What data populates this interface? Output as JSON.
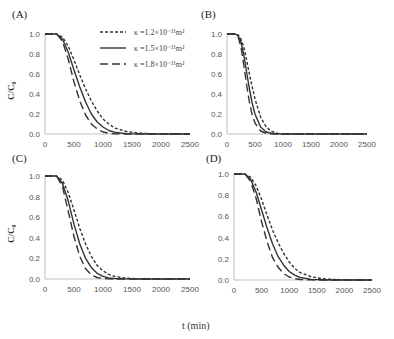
{
  "figure": {
    "x_axis_label": "t (min)",
    "y_axis_label": "C/C₀",
    "legend": [
      {
        "label": "κ =1.2×10⁻¹¹m²",
        "style": "short-dash"
      },
      {
        "label": "κ =1.5×10⁻¹¹m²",
        "style": "solid"
      },
      {
        "label": "κ =1.8×10⁻¹¹m²",
        "style": "long-dash"
      }
    ],
    "line_color": "#333333",
    "axis_color": "#bfbfbf"
  },
  "chart_data": [
    {
      "panel": "(A)",
      "type": "line",
      "title": "(A)",
      "xlabel": "t (min)",
      "ylabel": "C/C₀",
      "xlim": [
        0,
        2500
      ],
      "ylim": [
        0,
        1.0
      ],
      "xticks": [
        "0",
        "500",
        "1000",
        "1500",
        "2000",
        "2500"
      ],
      "yticks": [
        "0.0",
        "0.2",
        "0.4",
        "0.6",
        "0.8",
        "1.0"
      ],
      "grid": false,
      "legend_position": "upper right",
      "x": [
        0,
        200,
        300,
        400,
        500,
        600,
        700,
        800,
        900,
        1000,
        1100,
        1200,
        1400,
        1600,
        1800,
        2000,
        2500
      ],
      "series": [
        {
          "name": "κ =1.2×10⁻¹¹m²",
          "style": "short-dash",
          "values": [
            1.0,
            1.0,
            0.97,
            0.88,
            0.74,
            0.59,
            0.45,
            0.33,
            0.23,
            0.15,
            0.1,
            0.06,
            0.025,
            0.01,
            0.004,
            0.001,
            0.0
          ]
        },
        {
          "name": "κ =1.5×10⁻¹¹m²",
          "style": "solid",
          "values": [
            1.0,
            1.0,
            0.95,
            0.82,
            0.64,
            0.47,
            0.32,
            0.2,
            0.12,
            0.07,
            0.035,
            0.018,
            0.004,
            0.001,
            0.0,
            0.0,
            0.0
          ]
        },
        {
          "name": "κ =1.8×10⁻¹¹m²",
          "style": "long-dash",
          "values": [
            1.0,
            1.0,
            0.93,
            0.75,
            0.52,
            0.33,
            0.19,
            0.1,
            0.05,
            0.02,
            0.008,
            0.003,
            0.0,
            0.0,
            0.0,
            0.0,
            0.0
          ]
        }
      ]
    },
    {
      "panel": "(B)",
      "type": "line",
      "title": "(B)",
      "xlabel": "t (min)",
      "ylabel": "C/C₀",
      "xlim": [
        0,
        2500
      ],
      "ylim": [
        0,
        1.0
      ],
      "xticks": [
        "0",
        "500",
        "1000",
        "1500",
        "2000",
        "2500"
      ],
      "yticks": [
        "0.0",
        "0.2",
        "0.4",
        "0.6",
        "0.8",
        "1.0"
      ],
      "grid": false,
      "x": [
        0,
        150,
        200,
        250,
        300,
        350,
        400,
        450,
        500,
        600,
        700,
        800,
        900,
        1000,
        1500,
        2000,
        2500
      ],
      "series": [
        {
          "name": "κ =1.2×10⁻¹¹m²",
          "style": "short-dash",
          "values": [
            1.0,
            1.0,
            0.99,
            0.95,
            0.87,
            0.74,
            0.6,
            0.47,
            0.35,
            0.17,
            0.07,
            0.025,
            0.008,
            0.002,
            0.0,
            0.0,
            0.0
          ]
        },
        {
          "name": "κ =1.5×10⁻¹¹m²",
          "style": "solid",
          "values": [
            1.0,
            1.0,
            0.98,
            0.92,
            0.79,
            0.62,
            0.45,
            0.31,
            0.2,
            0.07,
            0.02,
            0.005,
            0.001,
            0.0,
            0.0,
            0.0,
            0.0
          ]
        },
        {
          "name": "κ =1.8×10⁻¹¹m²",
          "style": "long-dash",
          "values": [
            1.0,
            1.0,
            0.97,
            0.87,
            0.69,
            0.49,
            0.32,
            0.19,
            0.11,
            0.03,
            0.007,
            0.001,
            0.0,
            0.0,
            0.0,
            0.0,
            0.0
          ]
        }
      ]
    },
    {
      "panel": "(C)",
      "type": "line",
      "title": "(C)",
      "xlabel": "t (min)",
      "ylabel": "C/C₀",
      "xlim": [
        0,
        2500
      ],
      "ylim": [
        0,
        1.0
      ],
      "xticks": [
        "0",
        "500",
        "1000",
        "1500",
        "2000",
        "2500"
      ],
      "yticks": [
        "0.0",
        "0.2",
        "0.4",
        "0.6",
        "0.8",
        "1.0"
      ],
      "grid": false,
      "x": [
        0,
        200,
        300,
        400,
        500,
        600,
        700,
        800,
        900,
        1000,
        1100,
        1200,
        1400,
        1600,
        1800,
        2000,
        2500
      ],
      "series": [
        {
          "name": "κ =1.2×10⁻¹¹m²",
          "style": "short-dash",
          "values": [
            1.0,
            1.0,
            0.96,
            0.84,
            0.67,
            0.49,
            0.34,
            0.22,
            0.13,
            0.08,
            0.045,
            0.025,
            0.008,
            0.002,
            0.0,
            0.0,
            0.0
          ]
        },
        {
          "name": "κ =1.5×10⁻¹¹m²",
          "style": "solid",
          "values": [
            1.0,
            1.0,
            0.93,
            0.76,
            0.53,
            0.34,
            0.2,
            0.11,
            0.055,
            0.025,
            0.011,
            0.005,
            0.001,
            0.0,
            0.0,
            0.0,
            0.0
          ]
        },
        {
          "name": "κ =1.8×10⁻¹¹m²",
          "style": "long-dash",
          "values": [
            1.0,
            1.0,
            0.9,
            0.66,
            0.41,
            0.22,
            0.1,
            0.04,
            0.015,
            0.005,
            0.001,
            0.0,
            0.0,
            0.0,
            0.0,
            0.0,
            0.0
          ]
        }
      ]
    },
    {
      "panel": "(D)",
      "type": "line",
      "title": "(D)",
      "xlabel": "t (min)",
      "ylabel": "C/C₀",
      "xlim": [
        0,
        2500
      ],
      "ylim": [
        0,
        1.0
      ],
      "xticks": [
        "0",
        "500",
        "1000",
        "1500",
        "2000",
        "2500"
      ],
      "yticks": [
        "0.0",
        "0.2",
        "0.4",
        "0.6",
        "0.8",
        "1.0"
      ],
      "grid": false,
      "x": [
        0,
        200,
        300,
        400,
        500,
        600,
        700,
        800,
        900,
        1000,
        1100,
        1200,
        1400,
        1600,
        1800,
        2000,
        2500
      ],
      "series": [
        {
          "name": "κ =1.2×10⁻¹¹m²",
          "style": "short-dash",
          "values": [
            1.0,
            1.0,
            0.97,
            0.89,
            0.76,
            0.61,
            0.47,
            0.35,
            0.25,
            0.17,
            0.11,
            0.07,
            0.03,
            0.012,
            0.005,
            0.002,
            0.0
          ]
        },
        {
          "name": "κ =1.5×10⁻¹¹m²",
          "style": "solid",
          "values": [
            1.0,
            1.0,
            0.95,
            0.83,
            0.66,
            0.49,
            0.34,
            0.22,
            0.14,
            0.08,
            0.045,
            0.024,
            0.006,
            0.002,
            0.0,
            0.0,
            0.0
          ]
        },
        {
          "name": "κ =1.8×10⁻¹¹m²",
          "style": "long-dash",
          "values": [
            1.0,
            1.0,
            0.93,
            0.77,
            0.55,
            0.36,
            0.21,
            0.12,
            0.06,
            0.028,
            0.012,
            0.005,
            0.001,
            0.0,
            0.0,
            0.0,
            0.0
          ]
        }
      ]
    }
  ]
}
